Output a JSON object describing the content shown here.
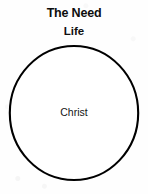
{
  "diagram": {
    "title": "The Need",
    "subtitle": "Life",
    "shape": {
      "icon": "circle-outline-icon",
      "label": "Christ",
      "stroke_color": "#000000",
      "fill_color": "#ffffff"
    },
    "background_color": "#fefefe",
    "text_color": "#0d0d0d"
  }
}
